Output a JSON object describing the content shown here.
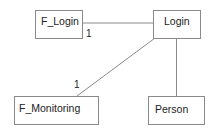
{
  "diagram": {
    "type": "uml-class-association",
    "nodes": [
      {
        "id": "f_login",
        "label": "F_Login"
      },
      {
        "id": "login",
        "label": "Login"
      },
      {
        "id": "f_monitoring",
        "label": "F_Monitoring"
      },
      {
        "id": "person",
        "label": "Person"
      }
    ],
    "edges": [
      {
        "from": "f_login",
        "to": "login",
        "multiplicity": "1"
      },
      {
        "from": "login",
        "to": "f_monitoring",
        "multiplicity": "1"
      },
      {
        "from": "login",
        "to": "person",
        "multiplicity": ""
      }
    ],
    "colors": {
      "line": "#8a8a8a",
      "text": "#222222",
      "background": "#ffffff"
    }
  }
}
